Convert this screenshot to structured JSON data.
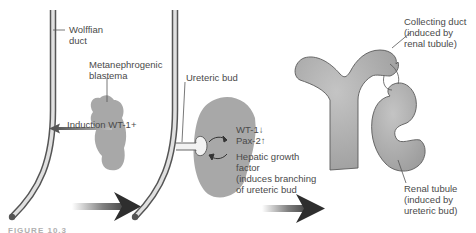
{
  "figure": {
    "caption_partial": "FIGURE 10.3",
    "colors": {
      "tissue_gray": "#a8a8a8",
      "duct_outline": "#555555",
      "label_text": "#4a4a4a",
      "arrow_dark": "#2e2e2e"
    },
    "panel1": {
      "wolffian_duct": [
        "Wolffian",
        "duct"
      ],
      "blastema": [
        "Metanephrogenic",
        "blastema"
      ],
      "induction": "Induction WT-1+"
    },
    "panel2": {
      "ureteric_bud": "Ureteric bud",
      "wt1": "WT-1↓",
      "pax2": "Pax-2↑",
      "hgf": [
        "Hepatic growth",
        "factor",
        "(induces branching",
        "of ureteric bud"
      ]
    },
    "panel3": {
      "collecting_duct": [
        "Collecting duct",
        "(induced by",
        "renal tubule)"
      ],
      "renal_tubule": [
        "Renal tubule",
        "(induced by",
        "ureteric bud)"
      ]
    }
  }
}
